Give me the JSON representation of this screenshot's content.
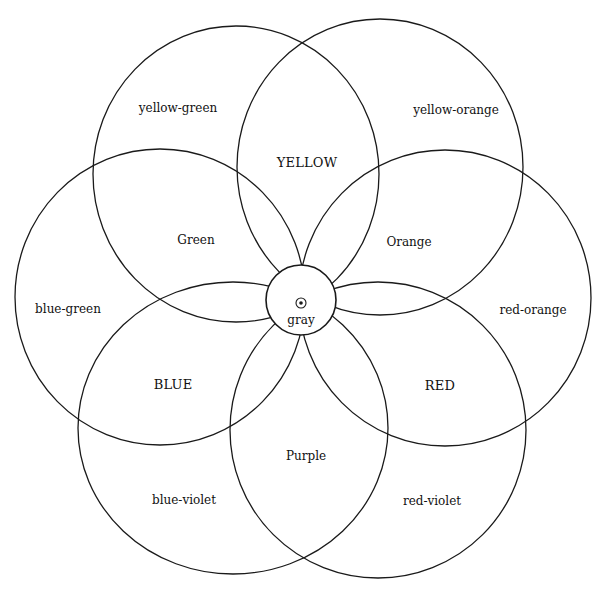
{
  "diagram": {
    "stroke_color": "#1a1a1a",
    "background": "#ffffff",
    "center": {
      "label": "gray",
      "cx": 301,
      "cy": 300,
      "r": 35
    },
    "ellipses": [
      {
        "id": "yellow-green-circle",
        "cx": 236,
        "cy": 174,
        "rx": 143,
        "ry": 148
      },
      {
        "id": "yellow-orange-circle",
        "cx": 380,
        "cy": 167,
        "rx": 143,
        "ry": 148
      },
      {
        "id": "blue-green-circle",
        "cx": 160,
        "cy": 297,
        "rx": 145,
        "ry": 148
      },
      {
        "id": "red-orange-circle",
        "cx": 445,
        "cy": 298,
        "rx": 146,
        "ry": 148
      },
      {
        "id": "blue-violet-circle",
        "cx": 233,
        "cy": 428,
        "rx": 155,
        "ry": 146
      },
      {
        "id": "red-violet-circle",
        "cx": 378,
        "cy": 430,
        "rx": 148,
        "ry": 148
      }
    ],
    "labels": {
      "yellow_green": {
        "text": "yellow-green",
        "x": 178,
        "y": 108
      },
      "yellow": {
        "text": "YELLOW",
        "x": 307,
        "y": 162
      },
      "yellow_orange": {
        "text": "yellow-orange",
        "x": 456,
        "y": 110
      },
      "green": {
        "text": "Green",
        "x": 196,
        "y": 240
      },
      "orange": {
        "text": "Orange",
        "x": 409,
        "y": 242
      },
      "blue_green": {
        "text": "blue-green",
        "x": 68,
        "y": 309
      },
      "gray": {
        "text": "gray",
        "x": 301,
        "y": 320
      },
      "red_orange": {
        "text": "red-orange",
        "x": 533,
        "y": 310
      },
      "blue": {
        "text": "BLUE",
        "x": 173,
        "y": 384
      },
      "red": {
        "text": "RED",
        "x": 440,
        "y": 385
      },
      "purple": {
        "text": "Purple",
        "x": 306,
        "y": 456
      },
      "blue_violet": {
        "text": "blue-violet",
        "x": 184,
        "y": 500
      },
      "red_violet": {
        "text": "red-violet",
        "x": 432,
        "y": 501
      }
    }
  }
}
